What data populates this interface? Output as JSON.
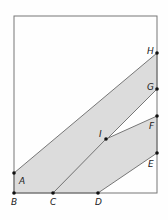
{
  "frame": {
    "x": 14,
    "y": 16,
    "w": 143,
    "h": 177
  },
  "colors": {
    "shade": "#dcdcdc",
    "stroke": "#777777",
    "point": "#111111",
    "background": "#fefefe"
  },
  "points": [
    {
      "name": "A",
      "x": 14,
      "y": 173,
      "lx": 19,
      "ly": 184
    },
    {
      "name": "B",
      "x": 14,
      "y": 193,
      "lx": 11,
      "ly": 205
    },
    {
      "name": "C",
      "x": 53,
      "y": 193,
      "lx": 50,
      "ly": 205
    },
    {
      "name": "D",
      "x": 98,
      "y": 193,
      "lx": 95,
      "ly": 205
    },
    {
      "name": "E",
      "x": 157,
      "y": 153,
      "lx": 148,
      "ly": 167
    },
    {
      "name": "F",
      "x": 157,
      "y": 116,
      "lx": 149,
      "ly": 129
    },
    {
      "name": "G",
      "x": 157,
      "y": 89,
      "lx": 147,
      "ly": 90
    },
    {
      "name": "H",
      "x": 157,
      "y": 53,
      "lx": 147,
      "ly": 54
    },
    {
      "name": "I",
      "x": 106,
      "y": 139,
      "lx": 99,
      "ly": 137
    }
  ],
  "regions": [
    {
      "name": "upper-band",
      "points": "14,173 157,53 157,89 53,193 14,193"
    },
    {
      "name": "lower-band",
      "points": "106,139 157,116 157,153 98,193 53,193"
    }
  ]
}
